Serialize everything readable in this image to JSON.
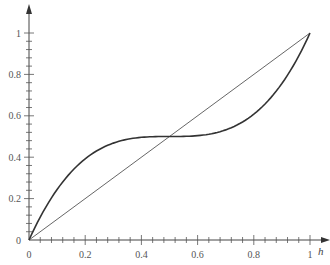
{
  "chart_data": {
    "type": "line",
    "title": "",
    "xlabel": "h",
    "ylabel": "",
    "xlim": [
      0,
      1
    ],
    "ylim": [
      0,
      1
    ],
    "x_ticks": [
      "0",
      "0.2",
      "0.4",
      "0.6",
      "0.8",
      "1"
    ],
    "y_ticks": [
      "0",
      "0.2",
      "0.4",
      "0.6",
      "0.8",
      "1"
    ],
    "minor_tick_step": 0.04,
    "grid": false,
    "legend": null,
    "series": [
      {
        "name": "diagonal",
        "style": "thin",
        "x": [
          0,
          1
        ],
        "values": [
          0,
          1
        ]
      },
      {
        "name": "S-curve",
        "style": "thick",
        "x": [
          0,
          0.1,
          0.2,
          0.3,
          0.4,
          0.5,
          0.6,
          0.7,
          0.8,
          0.9,
          1.0
        ],
        "values": [
          0,
          0.244,
          0.392,
          0.468,
          0.496,
          0.5,
          0.504,
          0.532,
          0.608,
          0.756,
          1.0
        ]
      }
    ]
  },
  "axes": {
    "x_var": "h"
  }
}
